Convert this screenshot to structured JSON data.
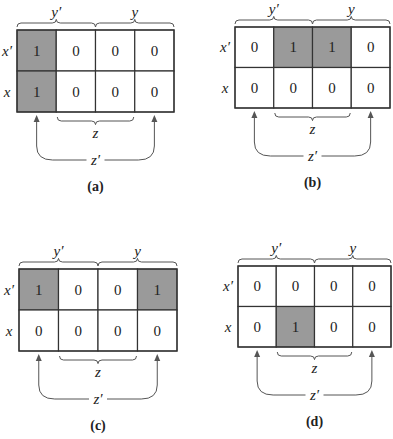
{
  "colors": {
    "shaded_cell": "#9a9a9a",
    "empty_cell": "#ffffff",
    "line": "#333333"
  },
  "labels": {
    "col_group_left": "y′",
    "col_group_right": "y",
    "row_top": "x′",
    "row_bottom": "x",
    "middle_brace": "z",
    "outer_brace": "z′"
  },
  "maps": [
    {
      "caption": "(a)",
      "cells": [
        [
          "1",
          "0",
          "0",
          "0"
        ],
        [
          "1",
          "0",
          "0",
          "0"
        ]
      ],
      "shaded": [
        [
          true,
          false,
          false,
          false
        ],
        [
          true,
          false,
          false,
          false
        ]
      ]
    },
    {
      "caption": "(b)",
      "cells": [
        [
          "0",
          "1",
          "1",
          "0"
        ],
        [
          "0",
          "0",
          "0",
          "0"
        ]
      ],
      "shaded": [
        [
          false,
          true,
          true,
          false
        ],
        [
          false,
          false,
          false,
          false
        ]
      ]
    },
    {
      "caption": "(c)",
      "cells": [
        [
          "1",
          "0",
          "0",
          "1"
        ],
        [
          "0",
          "0",
          "0",
          "0"
        ]
      ],
      "shaded": [
        [
          true,
          false,
          false,
          true
        ],
        [
          false,
          false,
          false,
          false
        ]
      ]
    },
    {
      "caption": "(d)",
      "cells": [
        [
          "0",
          "0",
          "0",
          "0"
        ],
        [
          "0",
          "1",
          "0",
          "0"
        ]
      ],
      "shaded": [
        [
          false,
          false,
          false,
          false
        ],
        [
          false,
          true,
          false,
          false
        ]
      ]
    }
  ]
}
